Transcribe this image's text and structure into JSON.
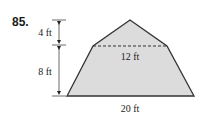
{
  "problem": {
    "number": "85."
  },
  "figure": {
    "shape": "pentagon (triangle atop trapezoid)",
    "fill_color": "#dcdcdc",
    "stroke_color": "#333333",
    "labels": {
      "top_height": "4 ft",
      "bottom_height": "8 ft",
      "mid_width": "12 ft",
      "base_width": "20 ft"
    },
    "dimensions": {
      "triangle_height_ft": 4,
      "trapezoid_height_ft": 8,
      "top_width_ft": 12,
      "base_width_ft": 20
    }
  }
}
